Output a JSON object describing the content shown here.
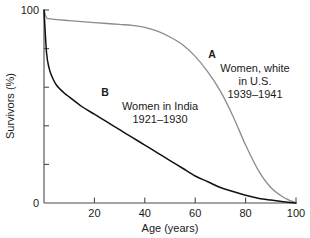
{
  "chart_data": {
    "type": "line",
    "title": "",
    "xlabel": "Age (years)",
    "ylabel": "Survivors (%)",
    "xlim": [
      0,
      100
    ],
    "ylim": [
      0,
      100
    ],
    "grid": false,
    "legend_position": "inline-annotations",
    "x_ticks": [
      0,
      20,
      40,
      60,
      80,
      100
    ],
    "x_tick_labels": [
      "",
      "20",
      "40",
      "60",
      "80",
      "100"
    ],
    "y_ticks": [
      0,
      20,
      40,
      60,
      80,
      100
    ],
    "y_tick_labels": [
      "0",
      "",
      "",
      "",
      "",
      "100"
    ],
    "x_origin_label": "",
    "y_origin_label": "0",
    "y_top_label": "100",
    "series": [
      {
        "name": "Women, white in U.S. 1939-1941",
        "key": "A",
        "color": "#8c8c8c",
        "x": [
          0,
          1,
          2,
          5,
          10,
          15,
          20,
          25,
          30,
          35,
          40,
          45,
          50,
          55,
          60,
          65,
          70,
          75,
          80,
          85,
          90,
          95,
          100
        ],
        "values": [
          100,
          96,
          95.5,
          95,
          94.5,
          94,
          93.5,
          93,
          92.5,
          92,
          91,
          89,
          86,
          82,
          76,
          68,
          58,
          45,
          30,
          17,
          8,
          3,
          0
        ]
      },
      {
        "name": "Women in India 1921-1930",
        "key": "B",
        "color": "#111111",
        "x": [
          0,
          1,
          2,
          3,
          5,
          8,
          10,
          15,
          20,
          25,
          30,
          35,
          40,
          45,
          50,
          55,
          60,
          65,
          70,
          75,
          80,
          85,
          90,
          95,
          100
        ],
        "values": [
          100,
          78,
          70,
          66,
          61,
          57,
          55,
          50,
          46,
          42,
          38,
          34,
          30,
          26,
          22,
          18,
          14,
          11,
          8,
          6,
          4,
          2.5,
          1.5,
          0.7,
          0
        ]
      }
    ],
    "annotations": [
      {
        "key": "A",
        "label": "A",
        "lines": [
          "Women, white",
          "in U.S.",
          "1939–1941"
        ],
        "align": "center"
      },
      {
        "key": "B",
        "label": "B",
        "lines": [
          "Women in India",
          "1921–1930"
        ],
        "align": "center"
      }
    ]
  }
}
